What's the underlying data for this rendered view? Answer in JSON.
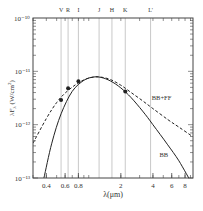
{
  "chart_data": {
    "type": "line",
    "title": "",
    "xlabel": "λ(μm)",
    "ylabel": "λF_λ (W/cm²)",
    "xscale": "log",
    "yscale": "log",
    "xlim": [
      0.3,
      9.5
    ],
    "ylim": [
      1e-13,
      1e-10
    ],
    "grid": false,
    "x_ticks": [
      {
        "value": 0.4,
        "label": "0.4"
      },
      {
        "value": 0.6,
        "label": "0.6"
      },
      {
        "value": 0.8,
        "label": "0.8"
      },
      {
        "value": 2,
        "label": "2"
      },
      {
        "value": 4,
        "label": "4"
      },
      {
        "value": 6,
        "label": "6"
      },
      {
        "value": 8,
        "label": "8"
      }
    ],
    "y_ticks": [
      {
        "value": 1e-10,
        "label": "10⁻¹⁰"
      },
      {
        "value": 1e-11,
        "label": "10⁻¹¹"
      },
      {
        "value": 1e-12,
        "label": "10⁻¹²"
      },
      {
        "value": 1e-13,
        "label": "10⁻¹³"
      }
    ],
    "bands": [
      {
        "name": "V",
        "lambda": 0.55
      },
      {
        "name": "R",
        "lambda": 0.64
      },
      {
        "name": "I",
        "lambda": 0.8
      },
      {
        "name": "J",
        "lambda": 1.25
      },
      {
        "name": "H",
        "lambda": 1.65
      },
      {
        "name": "K",
        "lambda": 2.2
      },
      {
        "name": "L'",
        "lambda": 3.8
      }
    ],
    "series": [
      {
        "name": "BB",
        "style": "solid",
        "x": [
          0.38,
          0.45,
          0.55,
          0.7,
          0.9,
          1.1,
          1.3,
          1.6,
          2.0,
          2.5,
          3.2,
          4.0,
          5.5,
          7.0,
          9.4
        ],
        "values": [
          1e-13,
          4.5e-13,
          1.6e-12,
          4.2e-12,
          6.8e-12,
          7.8e-12,
          7.7e-12,
          6.6e-12,
          4.9e-12,
          3.2e-12,
          1.8e-12,
          1e-12,
          4.2e-13,
          2.1e-13,
          7.5e-14
        ]
      },
      {
        "name": "BB+FF",
        "style": "dashed",
        "x": [
          0.3,
          0.4,
          0.5,
          0.6,
          0.75,
          0.9,
          1.1,
          1.3,
          1.6,
          2.0,
          2.5,
          3.2,
          4.0,
          5.5,
          7.0,
          9.4
        ],
        "values": [
          4.5e-13,
          1.3e-12,
          2.6e-12,
          3.9e-12,
          5.6e-12,
          6.9e-12,
          7.8e-12,
          7.8e-12,
          7e-12,
          5.5e-12,
          4e-12,
          2.8e-12,
          2e-12,
          1.25e-12,
          9e-13,
          6e-13
        ]
      },
      {
        "name": "observed",
        "style": "points",
        "x": [
          0.55,
          0.64,
          0.8,
          2.2
        ],
        "values": [
          2.9e-12,
          4.8e-12,
          6.5e-12,
          4.2e-12
        ]
      }
    ],
    "annotations": [
      {
        "text": "BB+FF",
        "lambda": 3.9,
        "value": 2.9e-12
      },
      {
        "text": "BB",
        "lambda": 4.6,
        "value": 2.5e-13
      }
    ]
  }
}
